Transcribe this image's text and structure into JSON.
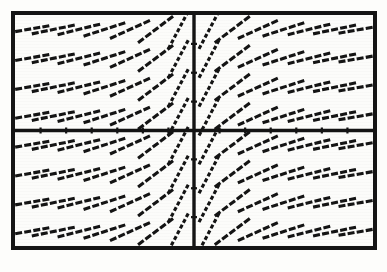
{
  "figure": {
    "kind": "slope-field",
    "background_color": "#fdfdfb",
    "ink_color": "#141414",
    "frame": {
      "border_color": "#151515",
      "border_width_px": 4,
      "left_px": 11,
      "top_px": 11,
      "width_px": 366,
      "height_px": 239
    }
  },
  "chart_data": {
    "type": "scatter",
    "title": "",
    "subtitle": "",
    "xlabel": "",
    "ylabel": "",
    "grid": false,
    "legend": null,
    "annotations": [],
    "axes": {
      "x_axis_visible": true,
      "y_axis_visible": true,
      "x_axis_pixel_y": 119,
      "y_axis_pixel_x": 186,
      "xlim": [
        -7,
        7
      ],
      "ylim": [
        -4,
        4
      ],
      "x_tick_labels": [],
      "y_tick_labels": [],
      "x_ticks": [
        -6,
        -5,
        -4,
        -3,
        -2,
        -1,
        1,
        2,
        3,
        4,
        5,
        6
      ],
      "y_ticks": [
        -3,
        -2,
        -1,
        1,
        2,
        3
      ]
    },
    "slope_model": {
      "expression": "dy/dx = 1/x",
      "segment_half_length_px": 22,
      "dash_pattern": "stair-stepped raster line",
      "columns_x": [
        -6.5,
        -5.5,
        -4.5,
        -3.5,
        -2.5,
        -1.5,
        -0.6,
        0.6,
        1.5,
        2.5,
        3.5,
        4.5,
        5.5,
        6.5
      ],
      "rows_y": [
        3.5,
        2.5,
        1.5,
        0.5,
        -0.5,
        -1.5,
        -2.5,
        -3.5
      ]
    },
    "x": [
      -6.5,
      -5.5,
      -4.5,
      -3.5,
      -2.5,
      -1.5,
      -0.6,
      0.6,
      1.5,
      2.5,
      3.5,
      4.5,
      5.5,
      6.5
    ],
    "series": [
      {
        "name": "slope at each grid column",
        "values": [
          0.154,
          0.182,
          0.222,
          0.286,
          0.4,
          0.667,
          1.667,
          1.667,
          0.667,
          0.4,
          0.286,
          0.222,
          0.182,
          0.154
        ]
      }
    ]
  }
}
